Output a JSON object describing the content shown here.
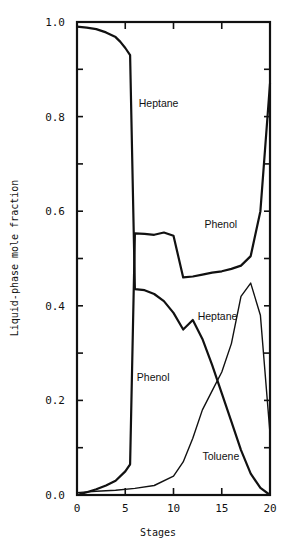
{
  "chart_data": {
    "type": "line",
    "title": "",
    "xlabel": "Stages",
    "ylabel": "Liquid-phase mole fraction",
    "xlim": [
      0,
      20
    ],
    "ylim": [
      0.0,
      1.0
    ],
    "xticks": [
      0,
      5,
      10,
      15,
      20
    ],
    "yticks": [
      0.0,
      0.2,
      0.4,
      0.6,
      0.8,
      1.0
    ],
    "ytick_labels": [
      "0.0",
      "0.2",
      "0.4",
      "0.6",
      "0.8",
      "1.0"
    ],
    "grid": false,
    "legend": "none (curves labeled inline)",
    "series": [
      {
        "name": "Heptane",
        "x": [
          0,
          1,
          2,
          3,
          4,
          4.5,
          5,
          5.5,
          6,
          7,
          8,
          9,
          10,
          11,
          12,
          13,
          14,
          15,
          16,
          17,
          18,
          19,
          20
        ],
        "values": [
          0.99,
          0.988,
          0.985,
          0.978,
          0.968,
          0.958,
          0.945,
          0.93,
          0.435,
          0.433,
          0.425,
          0.41,
          0.385,
          0.35,
          0.37,
          0.33,
          0.275,
          0.215,
          0.155,
          0.095,
          0.045,
          0.015,
          0.0
        ]
      },
      {
        "name": "Phenol",
        "x": [
          0,
          1,
          2,
          3,
          4,
          5,
          5.5,
          6,
          7,
          8,
          9,
          10,
          11,
          12,
          13,
          14,
          15,
          16,
          17,
          18,
          19,
          20
        ],
        "values": [
          0.0,
          0.006,
          0.012,
          0.02,
          0.03,
          0.05,
          0.065,
          0.553,
          0.552,
          0.55,
          0.555,
          0.548,
          0.46,
          0.462,
          0.466,
          0.47,
          0.473,
          0.478,
          0.485,
          0.505,
          0.6,
          0.87
        ]
      },
      {
        "name": "Toluene",
        "x": [
          0,
          2,
          4,
          6,
          8,
          10,
          11,
          12,
          13,
          14,
          15,
          16,
          17,
          18,
          19,
          20
        ],
        "values": [
          0.005,
          0.008,
          0.01,
          0.014,
          0.02,
          0.04,
          0.07,
          0.12,
          0.18,
          0.22,
          0.26,
          0.32,
          0.42,
          0.448,
          0.38,
          0.13
        ]
      }
    ],
    "annotations": [
      {
        "text": "Heptane",
        "x": 6.4,
        "y": 0.82
      },
      {
        "text": "Phenol",
        "x": 13.2,
        "y": 0.565
      },
      {
        "text": "Heptane",
        "x": 12.5,
        "y": 0.37
      },
      {
        "text": "Phenol",
        "x": 6.2,
        "y": 0.24
      },
      {
        "text": "Toluene",
        "x": 13.0,
        "y": 0.075
      }
    ]
  },
  "caption": "Figure"
}
